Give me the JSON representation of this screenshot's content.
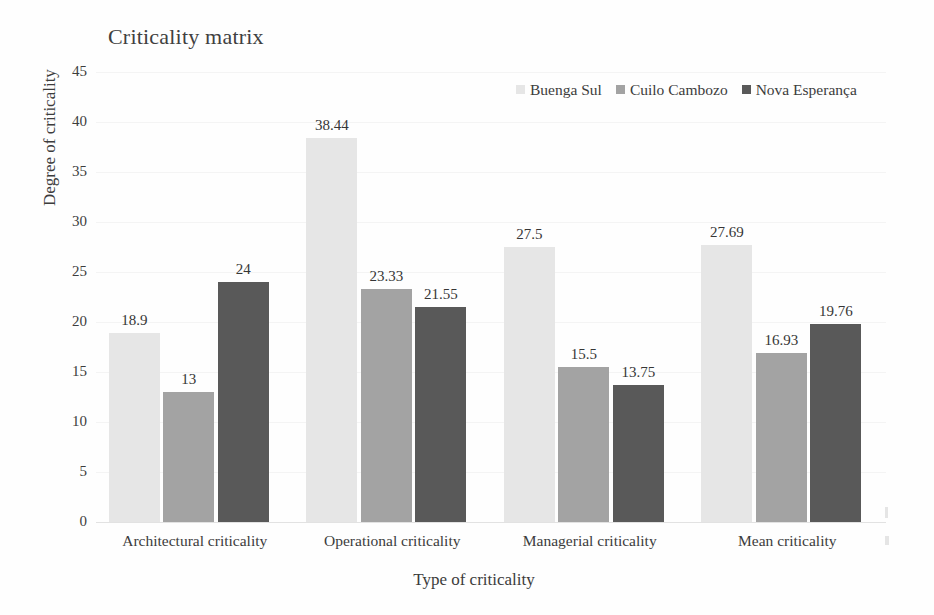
{
  "chart_data": {
    "type": "bar",
    "title": "Criticality matrix",
    "xlabel": "Type of criticality",
    "ylabel": "Degree of criticality",
    "categories": [
      "Architectural criticality",
      "Operational criticality",
      "Managerial criticality",
      "Mean criticality"
    ],
    "series": [
      {
        "name": "Buenga Sul",
        "color": "#e6e6e6",
        "values": [
          18.9,
          38.44,
          27.5,
          27.69
        ],
        "labels": [
          "18.9",
          "38.44",
          "27.5",
          "27.69"
        ]
      },
      {
        "name": "Cuilo Cambozo",
        "color": "#a3a3a3",
        "values": [
          13,
          23.33,
          15.5,
          16.93
        ],
        "labels": [
          "13",
          "23.33",
          "15.5",
          "16.93"
        ]
      },
      {
        "name": "Nova Esperança",
        "color": "#595959",
        "values": [
          24,
          21.55,
          13.75,
          19.76
        ],
        "labels": [
          "24",
          "21.55",
          "13.75",
          "19.76"
        ]
      }
    ],
    "ylim": [
      0,
      45
    ],
    "yticks": [
      0,
      5,
      10,
      15,
      20,
      25,
      30,
      35,
      40,
      45
    ],
    "ytick_labels": [
      "0",
      "5",
      "10",
      "15",
      "20",
      "25",
      "30",
      "35",
      "40",
      "45"
    ],
    "grid": true,
    "legend_position": "top-right",
    "bar_label_format": "value-above-bar"
  }
}
